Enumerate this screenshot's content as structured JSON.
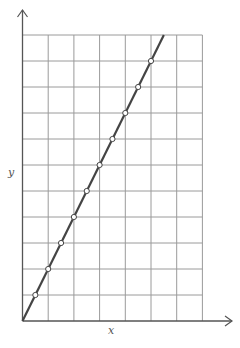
{
  "chart_data": {
    "type": "line",
    "title": "",
    "xlabel": "x",
    "ylabel": "y",
    "grid": true,
    "xlim": [
      0,
      7
    ],
    "ylim": [
      0,
      11
    ],
    "grid_columns": 7,
    "grid_rows": 11,
    "tick_labels": {
      "x": [],
      "y": []
    },
    "series": [
      {
        "name": "line",
        "color": "#444444",
        "marker": "open-circle",
        "line": {
          "from": [
            0,
            0
          ],
          "to": [
            5.5,
            11
          ]
        },
        "points": [
          {
            "x": 0.5,
            "y": 1
          },
          {
            "x": 1.0,
            "y": 2
          },
          {
            "x": 1.5,
            "y": 3
          },
          {
            "x": 2.0,
            "y": 4
          },
          {
            "x": 2.5,
            "y": 5
          },
          {
            "x": 3.0,
            "y": 6
          },
          {
            "x": 3.5,
            "y": 7
          },
          {
            "x": 4.0,
            "y": 8
          },
          {
            "x": 4.5,
            "y": 9
          },
          {
            "x": 5.0,
            "y": 10
          }
        ]
      }
    ]
  },
  "colors": {
    "grid": "#9a9a9a",
    "axis": "#555555",
    "line": "#444444",
    "marker_fill": "#ffffff"
  }
}
